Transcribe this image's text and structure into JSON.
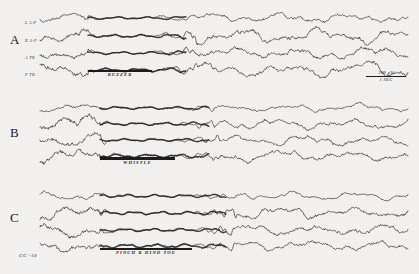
{
  "figure": {
    "background_color": "#f4f3f1",
    "ink_color": "#1c1c1c",
    "width": 419,
    "height": 274,
    "specimen_id": "CC -18"
  },
  "calibration": {
    "amplitude": "100 µV",
    "time": "1 SEC"
  },
  "sections": [
    {
      "letter": "A",
      "stimulus": "BUZZER",
      "stimulus_bar_style": "thin",
      "channels": [
        {
          "label": "L A-P"
        },
        {
          "label": "R A-P"
        },
        {
          "label": "A TR"
        },
        {
          "label": "P TR."
        }
      ]
    },
    {
      "letter": "B",
      "stimulus": "WHISTLE",
      "stimulus_bar_style": "thick",
      "channels": [
        {
          "label": ""
        },
        {
          "label": ""
        },
        {
          "label": ""
        },
        {
          "label": ""
        }
      ]
    },
    {
      "letter": "C",
      "stimulus": "PINCH R HIND TOE",
      "stimulus_bar_style": "thin",
      "channels": [
        {
          "label": ""
        },
        {
          "label": ""
        },
        {
          "label": ""
        },
        {
          "label": ""
        }
      ]
    }
  ],
  "chart_data": {
    "type": "line",
    "xlabel": "Time (1 SEC calibration bar)",
    "ylabel": "EEG potential (100 µV calibration bar)",
    "grid": false,
    "legend": "none",
    "x_range_seconds": [
      0,
      10
    ],
    "recording_id": "CC -18",
    "traces": [
      {
        "section": "A",
        "stimulus": "BUZZER",
        "stimulus_onset_x": 88,
        "stimulus_offset_x": 152,
        "channels": [
          {
            "name": "L A-P",
            "baseline_y": 18,
            "pre_amplitude": 3.0,
            "during_amplitude": 0.8,
            "post_amplitude": 2.8,
            "pre_frequency": 9,
            "during_frequency": 20,
            "post_frequency": 9
          },
          {
            "name": "R A-P",
            "baseline_y": 36,
            "pre_amplitude": 4.5,
            "during_amplitude": 1.0,
            "post_amplitude": 4.0,
            "pre_frequency": 8,
            "during_frequency": 22,
            "post_frequency": 8
          },
          {
            "name": "A TR",
            "baseline_y": 53,
            "pre_amplitude": 4.0,
            "during_amplitude": 0.9,
            "post_amplitude": 3.6,
            "pre_frequency": 8,
            "during_frequency": 21,
            "post_frequency": 9
          },
          {
            "name": "P TR.",
            "baseline_y": 70,
            "pre_amplitude": 4.2,
            "during_amplitude": 1.1,
            "post_amplitude": 3.8,
            "pre_frequency": 8,
            "during_frequency": 20,
            "post_frequency": 8
          }
        ]
      },
      {
        "section": "B",
        "stimulus": "WHISTLE",
        "stimulus_onset_x": 100,
        "stimulus_offset_x": 175,
        "channels": [
          {
            "name": "L A-P",
            "baseline_y": 108,
            "pre_amplitude": 2.6,
            "during_amplitude": 0.9,
            "post_amplitude": 2.4,
            "pre_frequency": 9,
            "during_frequency": 21,
            "post_frequency": 9
          },
          {
            "name": "R A-P",
            "baseline_y": 124,
            "pre_amplitude": 5.0,
            "during_amplitude": 1.0,
            "post_amplitude": 3.2,
            "pre_frequency": 7,
            "during_frequency": 22,
            "post_frequency": 9
          },
          {
            "name": "A TR",
            "baseline_y": 140,
            "pre_amplitude": 4.4,
            "during_amplitude": 0.9,
            "post_amplitude": 3.0,
            "pre_frequency": 8,
            "during_frequency": 21,
            "post_frequency": 9
          },
          {
            "name": "P TR.",
            "baseline_y": 156,
            "pre_amplitude": 4.6,
            "during_amplitude": 1.2,
            "post_amplitude": 3.2,
            "pre_frequency": 7,
            "during_frequency": 20,
            "post_frequency": 9
          }
        ]
      },
      {
        "section": "C",
        "stimulus": "PINCH R HIND TOE",
        "stimulus_onset_x": 100,
        "stimulus_offset_x": 192,
        "channels": [
          {
            "name": "L A-P",
            "baseline_y": 196,
            "pre_amplitude": 2.4,
            "during_amplitude": 1.0,
            "post_amplitude": 2.2,
            "pre_frequency": 10,
            "during_frequency": 22,
            "post_frequency": 10
          },
          {
            "name": "R A-P",
            "baseline_y": 213,
            "pre_amplitude": 4.8,
            "during_amplitude": 1.1,
            "post_amplitude": 3.4,
            "pre_frequency": 7,
            "during_frequency": 23,
            "post_frequency": 9
          },
          {
            "name": "A TR",
            "baseline_y": 230,
            "pre_amplitude": 4.4,
            "during_amplitude": 1.0,
            "post_amplitude": 3.6,
            "pre_frequency": 8,
            "during_frequency": 22,
            "post_frequency": 9
          },
          {
            "name": "P TR.",
            "baseline_y": 246,
            "pre_amplitude": 4.0,
            "during_amplitude": 1.3,
            "post_amplitude": 3.0,
            "pre_frequency": 8,
            "during_frequency": 21,
            "post_frequency": 9
          }
        ]
      }
    ]
  }
}
